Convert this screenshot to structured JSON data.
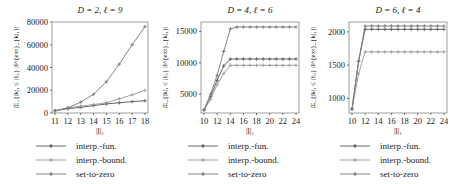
{
  "chart_data": [
    {
      "type": "line",
      "title": "D = 2, ℓ = 9",
      "xlabel": "|l|₁",
      "ylabel": "|Σ_{|k|₁ ≤ |l|₁} |I^{ext}_{k|₁}|",
      "x": [
        11,
        12,
        13,
        14,
        15,
        16,
        17,
        18
      ],
      "xticks": [
        11,
        12,
        13,
        14,
        15,
        16,
        17,
        18
      ],
      "yticks": [
        0,
        20000,
        40000,
        60000,
        80000
      ],
      "ylim": [
        0,
        80000
      ],
      "grid": false,
      "series": [
        {
          "name": "interp.-fun.",
          "values": [
            2000,
            3800,
            5000,
            6500,
            8000,
            9000,
            10000,
            10800
          ]
        },
        {
          "name": "interp.-bound.",
          "values": [
            2000,
            4500,
            6000,
            7500,
            9000,
            12500,
            16000,
            20000
          ]
        },
        {
          "name": "set-to-zero",
          "values": [
            2000,
            4500,
            9500,
            16500,
            27500,
            43000,
            60000,
            76000
          ]
        }
      ]
    },
    {
      "type": "line",
      "title": "D = 4, ℓ = 6",
      "xlabel": "|l|₁",
      "ylabel": "|Σ_{|k|₁ ≤ |l|₁} |I^{ext}_{k|₁}|",
      "x": [
        10,
        11,
        12,
        13,
        14,
        15,
        16,
        17,
        18,
        19,
        20,
        21,
        22,
        23,
        24
      ],
      "xticks": [
        10,
        12,
        14,
        16,
        18,
        20,
        22,
        24
      ],
      "yticks": [
        5000,
        10000,
        15000
      ],
      "ylim": [
        2000,
        16500
      ],
      "grid": false,
      "series": [
        {
          "name": "interp.-fun.",
          "values": [
            2500,
            4600,
            7200,
            9500,
            10600,
            10600,
            10600,
            10600,
            10600,
            10600,
            10600,
            10600,
            10600,
            10600,
            10600
          ]
        },
        {
          "name": "interp.-bound.",
          "values": [
            2500,
            4200,
            6500,
            8300,
            9600,
            9600,
            9600,
            9600,
            9600,
            9600,
            9600,
            9600,
            9600,
            9600,
            9600
          ]
        },
        {
          "name": "set-to-zero",
          "values": [
            2500,
            5000,
            8000,
            11800,
            15400,
            15700,
            15700,
            15700,
            15700,
            15700,
            15700,
            15700,
            15700,
            15700,
            15700
          ]
        }
      ]
    },
    {
      "type": "line",
      "title": "D = 6, ℓ = 4",
      "xlabel": "|l|₁",
      "ylabel": "|Σ_{|k|₁ ≤ |l|₁} |I^{ext}_{k|₁}|",
      "x": [
        10,
        11,
        12,
        13,
        14,
        15,
        16,
        17,
        18,
        19,
        20,
        21,
        22,
        23,
        24
      ],
      "xticks": [
        10,
        12,
        14,
        16,
        18,
        20,
        22,
        24
      ],
      "yticks": [
        1000,
        1500,
        2000
      ],
      "ylim": [
        780,
        2150
      ],
      "grid": false,
      "series": [
        {
          "name": "interp.-fun.",
          "values": [
            840,
            1560,
            2040,
            2040,
            2040,
            2040,
            2040,
            2040,
            2040,
            2040,
            2040,
            2040,
            2040,
            2040,
            2040
          ]
        },
        {
          "name": "interp.-bound.",
          "values": [
            840,
            1370,
            1700,
            1700,
            1700,
            1700,
            1700,
            1700,
            1700,
            1700,
            1700,
            1700,
            1700,
            1700,
            1700
          ]
        },
        {
          "name": "set-to-zero",
          "values": [
            840,
            1560,
            2090,
            2090,
            2090,
            2090,
            2090,
            2090,
            2090,
            2090,
            2090,
            2090,
            2090,
            2090,
            2090
          ]
        }
      ]
    }
  ],
  "legend": {
    "items": [
      {
        "label": "interp.-fun.",
        "color": "#555555"
      },
      {
        "label": "interp.-bound.",
        "color": "#999999"
      },
      {
        "label": "set-to-zero",
        "color": "#777777"
      }
    ]
  },
  "style": {
    "axis_color": "#333333",
    "series_colors": [
      "#555555",
      "#999999",
      "#777777"
    ]
  }
}
